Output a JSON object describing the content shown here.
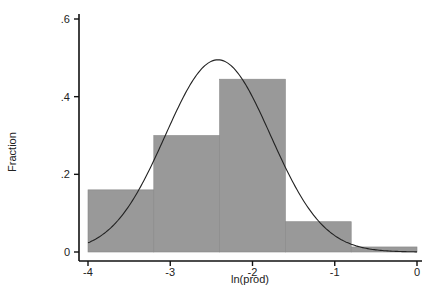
{
  "chart_data": {
    "type": "bar",
    "subtype": "histogram_with_normal_overlay",
    "title": "",
    "xlabel": "ln(prod)",
    "ylabel": "Fraction",
    "xlim": [
      -4,
      0
    ],
    "ylim": [
      0,
      0.6
    ],
    "x_ticks": [
      -4,
      -3,
      -2,
      -1,
      0
    ],
    "x_tick_labels": [
      "-4",
      "-3",
      "-2",
      "-1",
      "0"
    ],
    "y_ticks": [
      0,
      0.2,
      0.4,
      0.6
    ],
    "y_tick_labels": [
      "0",
      ".2",
      ".4",
      ".6"
    ],
    "bins": [
      {
        "x0": -4.0,
        "x1": -3.2,
        "value": 0.16
      },
      {
        "x0": -3.2,
        "x1": -2.4,
        "value": 0.3
      },
      {
        "x0": -2.4,
        "x1": -1.6,
        "value": 0.445
      },
      {
        "x0": -1.6,
        "x1": -0.8,
        "value": 0.078
      },
      {
        "x0": -0.8,
        "x1": 0.0,
        "value": 0.013
      }
    ],
    "overlay": {
      "type": "normal_density_scaled",
      "mean": -2.42,
      "sd": 0.64,
      "peak": 0.495
    },
    "grid": false,
    "legend": null,
    "colors": {
      "bar_fill": "#999999",
      "bar_edge": "#888888",
      "curve": "#222222",
      "axis": "#111111"
    }
  }
}
